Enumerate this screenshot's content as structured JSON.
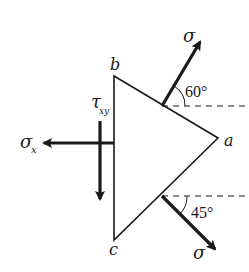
{
  "diagram": {
    "type": "stress-element",
    "vertices": {
      "a": "a",
      "b": "b",
      "c": "c"
    },
    "labels": {
      "sigma_upper": "σ",
      "sigma_lower": "σ",
      "sigma_x_main": "σ",
      "sigma_x_sub": "x",
      "tau_main": "τ",
      "tau_sub": "xy"
    },
    "angles": {
      "upper": "60°",
      "lower": "45°"
    },
    "colors": {
      "stroke": "#1a1a1a",
      "background": "#ffffff"
    }
  }
}
